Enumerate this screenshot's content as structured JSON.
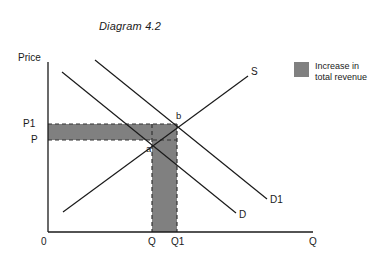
{
  "title": "Diagram 4.2",
  "axes": {
    "y_label": "Price",
    "x_label": "Q",
    "origin_label": "0"
  },
  "price_ticks": [
    {
      "label": "P1",
      "y": 124
    },
    {
      "label": "P",
      "y": 140
    }
  ],
  "quantity_ticks": [
    {
      "label": "Q",
      "x": 152
    },
    {
      "label": "Q1",
      "x": 177
    }
  ],
  "curves": [
    {
      "name": "supply",
      "label": "S",
      "x1": 63,
      "y1": 212,
      "x2": 248,
      "y2": 76
    },
    {
      "name": "demand-original",
      "label": "D",
      "x1": 62,
      "y1": 72,
      "x2": 236,
      "y2": 213
    },
    {
      "name": "demand-shifted",
      "label": "D1",
      "x1": 95,
      "y1": 60,
      "x2": 267,
      "y2": 199
    }
  ],
  "points": [
    {
      "label": "a",
      "x": 152,
      "y": 140
    },
    {
      "label": "b",
      "x": 177,
      "y": 124
    }
  ],
  "shaded_region": {
    "fill_color": "#808080",
    "horizontal_band": {
      "x": 48,
      "y": 124,
      "width": 129,
      "height": 16
    },
    "vertical_band": {
      "x": 152,
      "y": 124,
      "width": 25,
      "height": 108
    }
  },
  "legend": {
    "swatch_color": "#808080",
    "text_line_1": "Increase in",
    "text_line_2": "total revenue"
  },
  "chart_data": {
    "type": "line",
    "title": "Diagram 4.2",
    "xlabel": "Q",
    "ylabel": "Price",
    "grid": false,
    "legend_position": "right",
    "series": [
      {
        "name": "S",
        "type": "supply",
        "slope": "upward",
        "points": [
          {
            "x": 63,
            "y": 212
          },
          {
            "x": 248,
            "y": 76
          }
        ]
      },
      {
        "name": "D",
        "type": "demand",
        "slope": "downward",
        "points": [
          {
            "x": 62,
            "y": 72
          },
          {
            "x": 236,
            "y": 213
          }
        ]
      },
      {
        "name": "D1",
        "type": "demand",
        "slope": "downward",
        "points": [
          {
            "x": 95,
            "y": 60
          },
          {
            "x": 267,
            "y": 199
          }
        ]
      }
    ],
    "equilibria": [
      {
        "label": "a",
        "price": "P",
        "quantity": "Q"
      },
      {
        "label": "b",
        "price": "P1",
        "quantity": "Q1"
      }
    ],
    "annotations": [
      {
        "label": "Increase in total revenue",
        "shading": "#808080"
      }
    ]
  }
}
